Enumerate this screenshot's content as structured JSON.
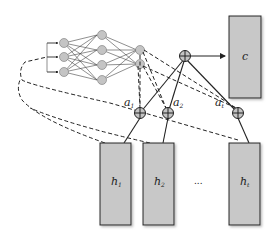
{
  "diagram": {
    "type": "attention-mechanism",
    "context_box": {
      "label": "c"
    },
    "hidden_states": [
      {
        "label": "h",
        "subscript": "1"
      },
      {
        "label": "h",
        "subscript": "2"
      },
      {
        "label": "h",
        "subscript": "t"
      }
    ],
    "ellipsis": "...",
    "weights": [
      {
        "label": "a",
        "subscript": "1"
      },
      {
        "label": "a",
        "subscript": "2"
      },
      {
        "label": "a",
        "subscript": "t"
      }
    ],
    "network": {
      "layers": [
        3,
        4,
        2
      ]
    },
    "colors": {
      "box_fill": "#c8c8c8",
      "node_fill": "#c4c4c4",
      "stroke": "#222222"
    }
  }
}
